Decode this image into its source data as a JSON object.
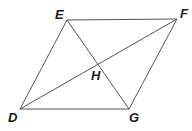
{
  "diagram": {
    "type": "parallelogram-with-diagonals",
    "points": {
      "D": {
        "label": "D",
        "x": 20,
        "y": 109,
        "lx": 8,
        "ly": 122
      },
      "E": {
        "label": "E",
        "x": 67,
        "y": 20,
        "lx": 55,
        "ly": 19
      },
      "F": {
        "label": "F",
        "x": 177,
        "y": 19,
        "lx": 180,
        "ly": 18
      },
      "G": {
        "label": "G",
        "x": 129,
        "y": 109,
        "lx": 129,
        "ly": 122
      },
      "H": {
        "label": "H",
        "x": 98,
        "y": 64,
        "lx": 91,
        "ly": 80
      }
    },
    "segments": [
      "DE",
      "EF",
      "FG",
      "GD",
      "DF",
      "EG"
    ],
    "line_color": "#555555"
  }
}
